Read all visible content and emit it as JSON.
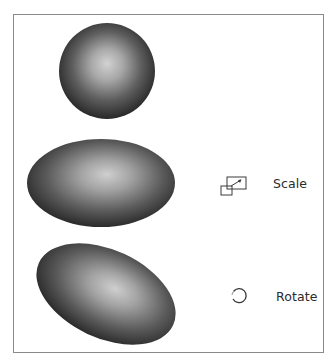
{
  "diagram": {
    "shapes": [
      {
        "id": "circle",
        "type": "sphere",
        "cx": 107,
        "cy": 71,
        "rx": 48,
        "ry": 48,
        "rotation": 0
      },
      {
        "id": "scaled-ellipse",
        "type": "ellipse",
        "cx": 101,
        "cy": 183,
        "rx": 74,
        "ry": 44,
        "rotation": 0
      },
      {
        "id": "rotated-ellipse",
        "type": "ellipse",
        "cx": 106,
        "cy": 294,
        "rx": 74,
        "ry": 44,
        "rotation": 25
      }
    ],
    "gradient": {
      "highlight": "#d2d2d2",
      "mid": "#7a7a7a",
      "edge": "#262626"
    },
    "frame_color": "#8a8a8a",
    "operations": [
      {
        "label": "Scale",
        "icon": "scale-icon"
      },
      {
        "label": "Rotate",
        "icon": "rotate-icon"
      }
    ]
  }
}
